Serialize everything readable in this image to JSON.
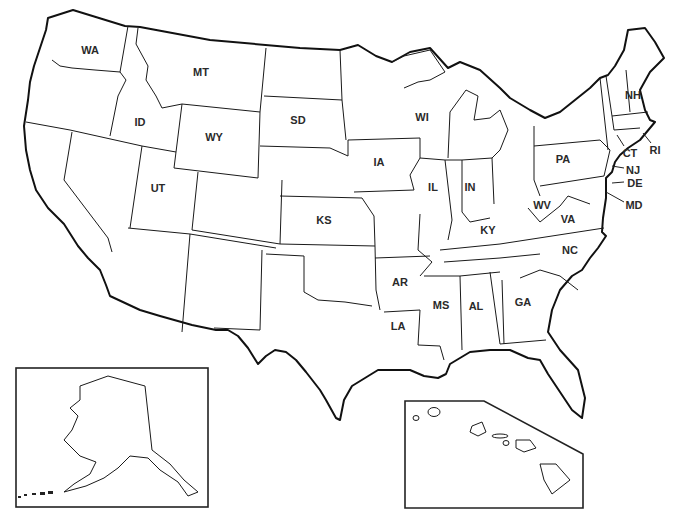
{
  "map": {
    "title": "Outline map of the United States",
    "colors": {
      "background": "#ffffff",
      "line": "#1a1a1a",
      "label": "#2a2a2a"
    },
    "insets": [
      {
        "name": "Alaska",
        "box": [
          16,
          368,
          192,
          257
        ]
      },
      {
        "name": "Hawaii",
        "box": [
          405,
          401,
          583,
          508
        ]
      }
    ],
    "labels": [
      {
        "id": "WA",
        "text": "WA",
        "x": 90,
        "y": 50
      },
      {
        "id": "MT",
        "text": "MT",
        "x": 201,
        "y": 72
      },
      {
        "id": "ID",
        "text": "ID",
        "x": 140,
        "y": 122
      },
      {
        "id": "WY",
        "text": "WY",
        "x": 214,
        "y": 137
      },
      {
        "id": "SD",
        "text": "SD",
        "x": 298,
        "y": 120
      },
      {
        "id": "UT",
        "text": "UT",
        "x": 158,
        "y": 188
      },
      {
        "id": "KS",
        "text": "KS",
        "x": 324,
        "y": 220
      },
      {
        "id": "IA",
        "text": "IA",
        "x": 379,
        "y": 162
      },
      {
        "id": "WI",
        "text": "WI",
        "x": 422,
        "y": 117
      },
      {
        "id": "IL",
        "text": "IL",
        "x": 433,
        "y": 187
      },
      {
        "id": "IN",
        "text": "IN",
        "x": 470,
        "y": 187
      },
      {
        "id": "PA",
        "text": "PA",
        "x": 563,
        "y": 159
      },
      {
        "id": "NH",
        "text": "NH",
        "x": 633,
        "y": 95
      },
      {
        "id": "CT",
        "text": "CT",
        "x": 630,
        "y": 153
      },
      {
        "id": "RI",
        "text": "RI",
        "x": 655,
        "y": 150
      },
      {
        "id": "NJ",
        "text": "NJ",
        "x": 633,
        "y": 170
      },
      {
        "id": "DE",
        "text": "DE",
        "x": 635,
        "y": 183
      },
      {
        "id": "MD",
        "text": "MD",
        "x": 634,
        "y": 205
      },
      {
        "id": "WV",
        "text": "WV",
        "x": 542,
        "y": 205
      },
      {
        "id": "VA",
        "text": "VA",
        "x": 568,
        "y": 219
      },
      {
        "id": "KY",
        "text": "KY",
        "x": 488,
        "y": 230
      },
      {
        "id": "NC",
        "text": "NC",
        "x": 570,
        "y": 250
      },
      {
        "id": "AR",
        "text": "AR",
        "x": 400,
        "y": 282
      },
      {
        "id": "MS",
        "text": "MS",
        "x": 441,
        "y": 305
      },
      {
        "id": "AL",
        "text": "AL",
        "x": 476,
        "y": 306
      },
      {
        "id": "GA",
        "text": "GA",
        "x": 523,
        "y": 302
      },
      {
        "id": "LA",
        "text": "LA",
        "x": 398,
        "y": 326
      }
    ]
  }
}
